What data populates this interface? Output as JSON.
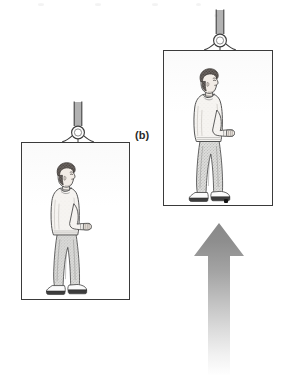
{
  "figure": {
    "panel_label": "(b)",
    "caption_text": "",
    "colors": {
      "ink": "#3a3a3a",
      "line": "#2a2a2a",
      "paper": "#ffffff",
      "arrow_top": "#8c8c8c",
      "arrow_bottom": "#ffffff",
      "dot": "#141414",
      "skin": "#f2ece6",
      "sweater": "#f5f3ef",
      "jeans": "#d8d8d6",
      "hair": "#4a4442",
      "shoe_white": "#fbfbfb",
      "shoe_sole": "#3d3d3d"
    }
  },
  "panels": [
    {
      "id": "lower-elevator",
      "name": "elevator-car-lower",
      "label": "",
      "box": {
        "x": 21,
        "y": 142,
        "width": 109,
        "height": 158
      },
      "cable": {
        "x": 59,
        "y": 101,
        "width": 38,
        "height": 42
      },
      "person": {
        "x": 40,
        "y": 160,
        "width": 58,
        "height": 137
      },
      "floor_dot": null
    },
    {
      "id": "upper-elevator",
      "name": "elevator-car-upper",
      "label": "(b)",
      "box": {
        "x": 163,
        "y": 50,
        "width": 110,
        "height": 156
      },
      "cable": {
        "x": 201,
        "y": 9,
        "width": 38,
        "height": 42
      },
      "person": {
        "x": 183,
        "y": 66,
        "width": 58,
        "height": 138
      },
      "floor_dot": {
        "x": 224,
        "y": 199,
        "width": 4,
        "height": 4
      }
    }
  ],
  "label_position": {
    "x": 135,
    "y": 129
  },
  "arrow": {
    "name": "acceleration-arrow",
    "direction": "up",
    "meaning": "acceleration",
    "x": 192,
    "y": 222,
    "width": 54,
    "height": 152,
    "shaft_width": 22,
    "head_width": 52,
    "head_height": 34,
    "gradient_top_color": "#8a8a8a",
    "gradient_bottom_color": "#ffffff"
  },
  "person_parts": {
    "head": "head",
    "hair": "hair",
    "face": "face-profile",
    "sweater": "sweater",
    "arm": "extended-arm",
    "hand": "hand",
    "jeans": "jeans",
    "shoes": "shoes"
  },
  "artifacts": [
    {
      "x": 38,
      "y": 3,
      "w": 6,
      "h": 3
    },
    {
      "x": 95,
      "y": 3,
      "w": 6,
      "h": 3
    },
    {
      "x": 152,
      "y": 3,
      "w": 6,
      "h": 3
    },
    {
      "x": 196,
      "y": 3,
      "w": 5,
      "h": 3
    },
    {
      "x": 214,
      "y": 14,
      "w": 4,
      "h": 3
    }
  ]
}
